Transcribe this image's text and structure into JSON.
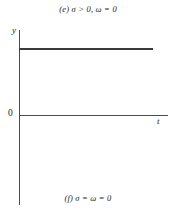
{
  "figure": {
    "caption_top": "(e) σ > 0, ω = 0",
    "caption_bottom": "(f) σ = ω = 0",
    "axis_label_y": "y",
    "axis_label_t": "t",
    "origin_label": "0",
    "colors": {
      "background": "#ffffff",
      "axis": "#4a4a4a",
      "curve": "#3a3a3a",
      "text": "#1c1c1c"
    }
  },
  "chart_data": {
    "type": "line",
    "title": "(e) σ > 0, ω = 0",
    "subtitle": "(f) σ = ω = 0",
    "xlabel": "t",
    "ylabel": "y",
    "grid": false,
    "legend": "none",
    "xlim": [
      0,
      1
    ],
    "ylim": [
      -1.18,
      1.18
    ],
    "tick_labels": {
      "x": [],
      "y": [
        "0"
      ]
    },
    "annotations": [
      "0"
    ],
    "series": [
      {
        "name": "y = constant > 0",
        "x": [
          0,
          0.125,
          0.25,
          0.375,
          0.5,
          0.625,
          0.75,
          0.875,
          1
        ],
        "values": [
          0.92,
          0.92,
          0.92,
          0.92,
          0.92,
          0.92,
          0.92,
          0.92,
          0.92
        ]
      }
    ]
  }
}
